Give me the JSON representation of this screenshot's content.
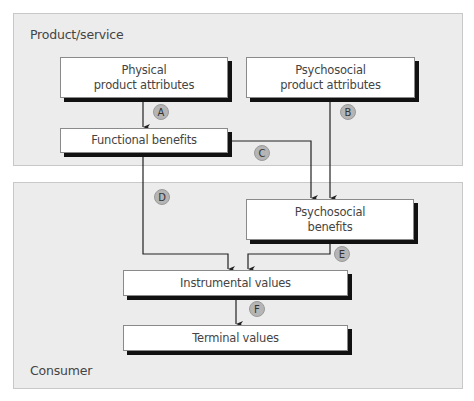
{
  "panels": {
    "product_service": {
      "label": "Product/service"
    },
    "consumer": {
      "label": "Consumer"
    }
  },
  "nodes": {
    "physical_attributes": {
      "line1": "Physical",
      "line2": "product attributes"
    },
    "psychosocial_attributes": {
      "line1": "Psychosocial",
      "line2": "product attributes"
    },
    "functional_benefits": {
      "line1": "Functional benefits"
    },
    "psychosocial_benefits": {
      "line1": "Psychosocial",
      "line2": "benefits"
    },
    "instrumental_values": {
      "line1": "Instrumental values"
    },
    "terminal_values": {
      "line1": "Terminal values"
    }
  },
  "links": [
    {
      "id": "A",
      "from": "Physical product attributes",
      "to": "Functional benefits"
    },
    {
      "id": "B",
      "from": "Psychosocial product attributes",
      "to": "Psychosocial benefits"
    },
    {
      "id": "C",
      "from": "Functional benefits",
      "to": "Psychosocial benefits"
    },
    {
      "id": "D",
      "from": "Functional benefits",
      "to": "Instrumental values"
    },
    {
      "id": "E",
      "from": "Psychosocial benefits",
      "to": "Instrumental values"
    },
    {
      "id": "F",
      "from": "Instrumental values",
      "to": "Terminal values"
    }
  ],
  "colors": {
    "panel_bg": "#ececec",
    "badge_bg": "#b5b5b5",
    "shadow": "#111111",
    "line": "#222222"
  }
}
